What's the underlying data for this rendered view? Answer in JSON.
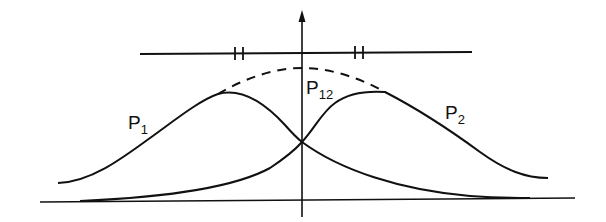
{
  "diagram": {
    "type": "overlapping-wavepackets",
    "colors": {
      "stroke": "#111111",
      "background": "#ffffff"
    },
    "labels": {
      "p1": {
        "base": "P",
        "sub": "1"
      },
      "p2": {
        "base": "P",
        "sub": "2"
      },
      "p12": {
        "base": "P",
        "sub": "12"
      }
    },
    "elements": [
      "vertical-axis-with-arrow",
      "baseline",
      "horizontal-reference-line-with-double-tick-marks",
      "curve-p1",
      "curve-p2",
      "dashed-envelope-p12"
    ]
  }
}
